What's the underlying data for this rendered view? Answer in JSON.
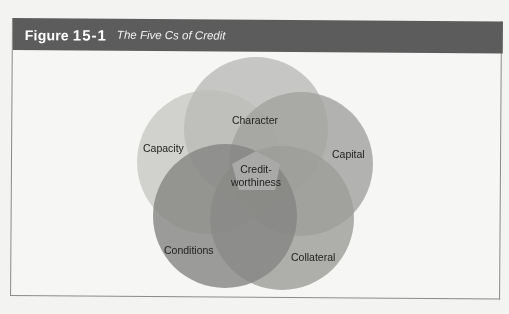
{
  "figure": {
    "number_prefix": "Figure",
    "number": "15-1",
    "title": "The Five Cs of Credit"
  },
  "diagram": {
    "type": "venn",
    "center_label_line1": "Credit-",
    "center_label_line2": "worthiness",
    "circles": [
      {
        "label": "Character",
        "color": "#b0b0b0"
      },
      {
        "label": "Capacity",
        "color": "#c4c4c4"
      },
      {
        "label": "Capital",
        "color": "#9a9a9a"
      },
      {
        "label": "Conditions",
        "color": "#6e6e6e"
      },
      {
        "label": "Collateral",
        "color": "#8a8a8a"
      }
    ]
  }
}
